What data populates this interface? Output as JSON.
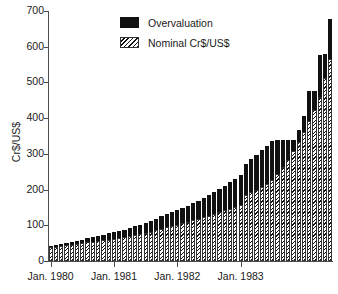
{
  "chart_data": {
    "type": "bar",
    "title": "",
    "subtitle": "",
    "xlabel": "",
    "ylabel": "Cr$/US$",
    "ylim": [
      0,
      700
    ],
    "yticks": [
      0,
      100,
      200,
      300,
      400,
      500,
      600,
      700
    ],
    "ytick_labels": [
      "0",
      "100",
      "200",
      "300",
      "400",
      "500",
      "600",
      "700"
    ],
    "grid": false,
    "stacked": true,
    "legend_position": "top-center",
    "legend": [
      "Overvaluation",
      "Nominal Cr$/US$"
    ],
    "xtick_labels": [
      "Jan. 1980",
      "Jan. 1981",
      "Jan. 1982",
      "Jan. 1983"
    ],
    "xtick_indices": [
      0,
      12,
      24,
      36
    ],
    "categories": [
      "Jan. 1980",
      "Feb. 1980",
      "Mar. 1980",
      "Apr. 1980",
      "May 1980",
      "Jun. 1980",
      "Jul. 1980",
      "Aug. 1980",
      "Sep. 1980",
      "Oct. 1980",
      "Nov. 1980",
      "Dec. 1980",
      "Jan. 1981",
      "Feb. 1981",
      "Mar. 1981",
      "Apr. 1981",
      "May 1981",
      "Jun. 1981",
      "Jul. 1981",
      "Aug. 1981",
      "Sep. 1981",
      "Oct. 1981",
      "Nov. 1981",
      "Dec. 1981",
      "Jan. 1982",
      "Feb. 1982",
      "Mar. 1982",
      "Apr. 1982",
      "May 1982",
      "Jun. 1982",
      "Jul. 1982",
      "Aug. 1982",
      "Sep. 1982",
      "Oct. 1982",
      "Nov. 1982",
      "Dec. 1982",
      "Jan. 1983",
      "Feb. 1983",
      "Mar. 1983",
      "Apr. 1983",
      "May 1983",
      "Jun. 1983",
      "Jul. 1983",
      "Aug. 1983",
      "Sep. 1983",
      "Oct. 1983",
      "Nov. 1983",
      "Dec. 1983",
      "Jan. 1984",
      "Feb. 1984",
      "Mar. 1984",
      "Apr. 1984",
      "May 1984",
      "Jun. 1984"
    ],
    "series": [
      {
        "name": "Nominal Cr$/US$",
        "pattern": "hatch",
        "color": "#111111",
        "values": [
          38,
          40,
          42,
          44,
          46,
          48,
          50,
          52,
          54,
          56,
          58,
          60,
          62,
          64,
          66,
          69,
          72,
          75,
          78,
          82,
          86,
          90,
          94,
          98,
          102,
          106,
          110,
          114,
          118,
          122,
          127,
          132,
          137,
          142,
          147,
          152,
          158,
          185,
          192,
          199,
          206,
          215,
          228,
          244,
          262,
          284,
          308,
          334,
          362,
          392,
          424,
          460,
          512,
          566
        ]
      },
      {
        "name": "Overvaluation",
        "pattern": "solid",
        "color": "#111111",
        "values": [
          4,
          5,
          6,
          7,
          8,
          9,
          10,
          12,
          13,
          15,
          16,
          18,
          19,
          21,
          22,
          24,
          26,
          27,
          29,
          31,
          33,
          35,
          37,
          39,
          41,
          43,
          45,
          48,
          51,
          54,
          57,
          61,
          65,
          69,
          73,
          77,
          82,
          88,
          93,
          98,
          104,
          108,
          108,
          94,
          78,
          56,
          30,
          32,
          45,
          84,
          52,
          118,
          67,
          111
        ]
      }
    ],
    "totals": [
      42,
      45,
      48,
      51,
      54,
      57,
      60,
      64,
      67,
      71,
      74,
      78,
      81,
      85,
      88,
      93,
      98,
      102,
      107,
      113,
      119,
      125,
      131,
      137,
      143,
      149,
      155,
      162,
      169,
      176,
      184,
      193,
      202,
      211,
      220,
      229,
      240,
      273,
      285,
      297,
      310,
      323,
      336,
      338,
      340,
      340,
      338,
      366,
      407,
      476,
      476,
      578,
      579,
      677
    ]
  },
  "axis": {
    "y_title": "Cr$/US$"
  }
}
